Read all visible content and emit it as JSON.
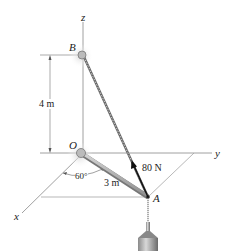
{
  "diagram": {
    "type": "3d-statics-figure",
    "axes": {
      "x": "x",
      "y": "y",
      "z": "z"
    },
    "points": {
      "origin": "O",
      "top": "B",
      "end": "A"
    },
    "dimensions": {
      "height": "4 m",
      "boom_length": "3 m",
      "angle": "60°"
    },
    "force": {
      "label": "80 N"
    },
    "colors": {
      "line": "#888888",
      "rod": "#a0a0a0",
      "arrow": "#111111",
      "text": "#222222"
    }
  }
}
